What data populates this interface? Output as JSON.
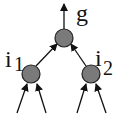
{
  "diagram": {
    "type": "tree",
    "nodes": [
      {
        "id": "g",
        "label": "g",
        "subscript": ""
      },
      {
        "id": "i1",
        "label": "i",
        "subscript": "1"
      },
      {
        "id": "i2",
        "label": "i",
        "subscript": "2"
      }
    ],
    "edges": [
      {
        "from": "i1",
        "to": "g"
      },
      {
        "from": "i2",
        "to": "g"
      },
      {
        "from": "g",
        "to": "output"
      },
      {
        "from": "input",
        "to": "i1"
      },
      {
        "from": "input",
        "to": "i1"
      },
      {
        "from": "input",
        "to": "i2"
      },
      {
        "from": "input",
        "to": "i2"
      }
    ],
    "colors": {
      "node_fill": "#7a7a7a",
      "stroke": "#111111",
      "background": "#ffffff"
    }
  }
}
